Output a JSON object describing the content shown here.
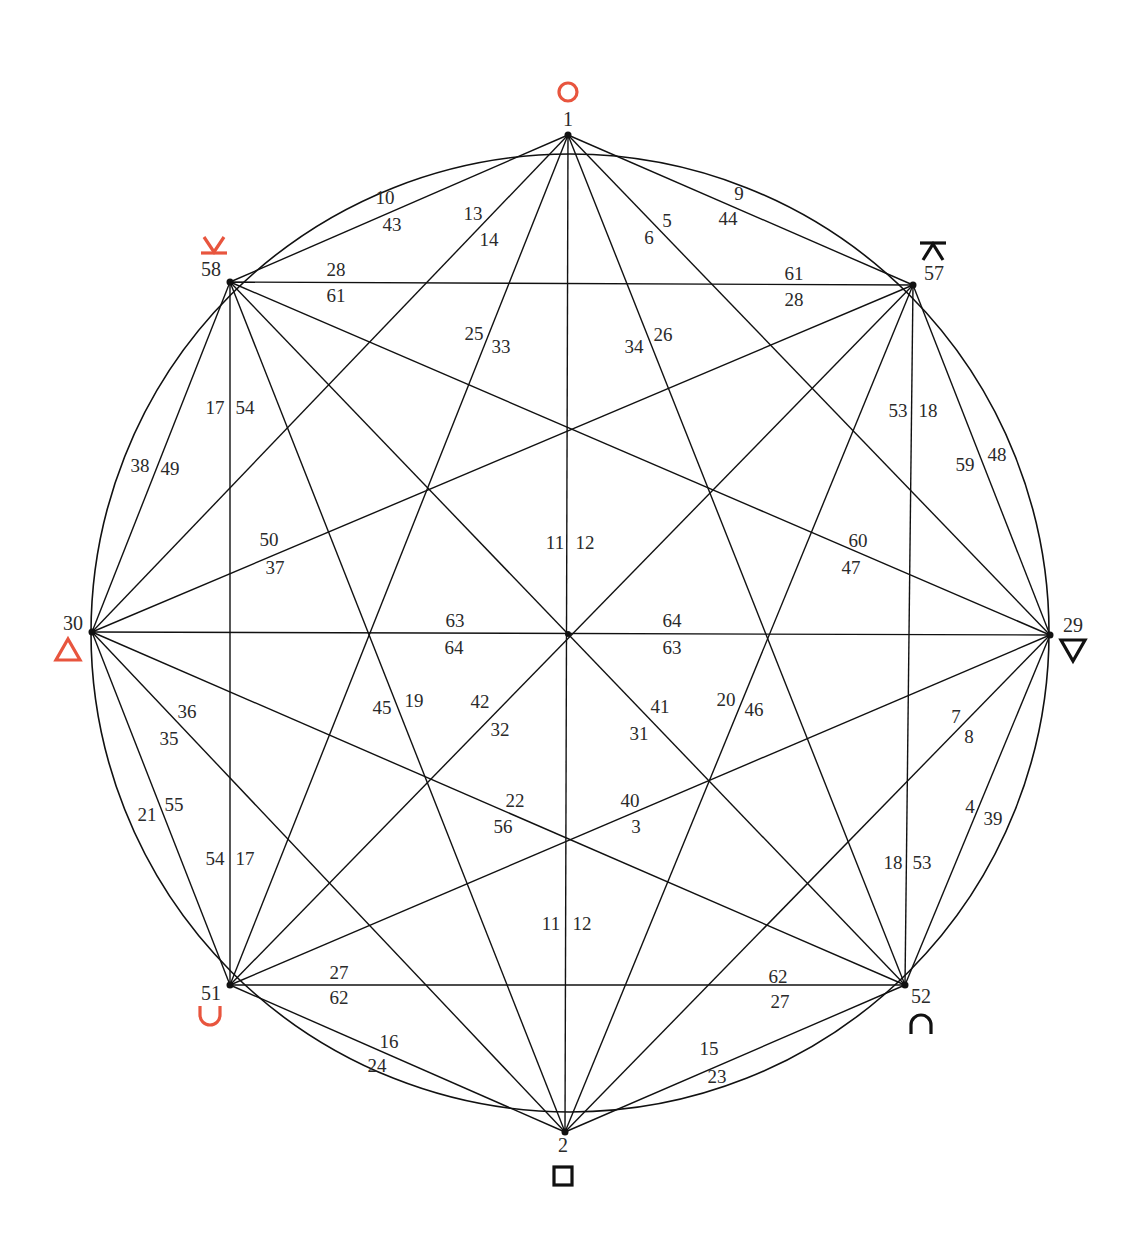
{
  "diagram": {
    "title": "",
    "circle": {
      "cx": 570,
      "cy": 633,
      "r": 479
    },
    "colors": {
      "line": "#111111",
      "accent_red": "#e8553e",
      "symbol_black": "#111111",
      "text": "#2a2a2a"
    },
    "vertices": [
      {
        "id": "v1",
        "label": "1",
        "x": 568,
        "y": 135,
        "lx": 568,
        "ly": 126,
        "symbol": "circle",
        "symbol_color": "red",
        "sx": 568,
        "sy": 92
      },
      {
        "id": "v57",
        "label": "57",
        "x": 913,
        "y": 285,
        "lx": 934,
        "ly": 280,
        "symbol": "bar-over-wedge",
        "symbol_color": "black",
        "sx": 933,
        "sy": 251
      },
      {
        "id": "v29",
        "label": "29",
        "x": 1050,
        "y": 635,
        "lx": 1073,
        "ly": 632,
        "symbol": "triangle-down",
        "symbol_color": "black",
        "sx": 1073,
        "sy": 650
      },
      {
        "id": "v52",
        "label": "52",
        "x": 905,
        "y": 985,
        "lx": 921,
        "ly": 1003,
        "symbol": "cap",
        "symbol_color": "black",
        "sx": 921,
        "sy": 1025
      },
      {
        "id": "v2",
        "label": "2",
        "x": 565,
        "y": 1132,
        "lx": 563,
        "ly": 1152,
        "symbol": "square",
        "symbol_color": "black",
        "sx": 563,
        "sy": 1176
      },
      {
        "id": "v51",
        "label": "51",
        "x": 230,
        "y": 985,
        "lx": 211,
        "ly": 1000,
        "symbol": "cup",
        "symbol_color": "red",
        "sx": 210,
        "sy": 1015
      },
      {
        "id": "v30",
        "label": "30",
        "x": 92,
        "y": 632,
        "lx": 73,
        "ly": 630,
        "symbol": "triangle-up",
        "symbol_color": "red",
        "sx": 68,
        "sy": 650
      },
      {
        "id": "v58",
        "label": "58",
        "x": 230,
        "y": 282,
        "lx": 211,
        "ly": 276,
        "symbol": "wedge-over-bar",
        "symbol_color": "red",
        "sx": 214,
        "sy": 246
      }
    ],
    "edges": [
      [
        "v1",
        "v57"
      ],
      [
        "v1",
        "v29"
      ],
      [
        "v1",
        "v52"
      ],
      [
        "v1",
        "v2"
      ],
      [
        "v1",
        "v51"
      ],
      [
        "v1",
        "v30"
      ],
      [
        "v1",
        "v58"
      ],
      [
        "v57",
        "v29"
      ],
      [
        "v57",
        "v52"
      ],
      [
        "v57",
        "v2"
      ],
      [
        "v57",
        "v51"
      ],
      [
        "v57",
        "v30"
      ],
      [
        "v57",
        "v58"
      ],
      [
        "v29",
        "v52"
      ],
      [
        "v29",
        "v2"
      ],
      [
        "v29",
        "v51"
      ],
      [
        "v29",
        "v30"
      ],
      [
        "v29",
        "v58"
      ],
      [
        "v52",
        "v2"
      ],
      [
        "v52",
        "v51"
      ],
      [
        "v52",
        "v30"
      ],
      [
        "v52",
        "v58"
      ],
      [
        "v2",
        "v51"
      ],
      [
        "v2",
        "v30"
      ],
      [
        "v2",
        "v58"
      ],
      [
        "v51",
        "v30"
      ],
      [
        "v51",
        "v58"
      ],
      [
        "v30",
        "v58"
      ]
    ],
    "edge_labels": [
      {
        "text": "10",
        "x": 385,
        "y": 204
      },
      {
        "text": "43",
        "x": 392,
        "y": 231
      },
      {
        "text": "13",
        "x": 473,
        "y": 220
      },
      {
        "text": "14",
        "x": 489,
        "y": 246
      },
      {
        "text": "9",
        "x": 739,
        "y": 200
      },
      {
        "text": "44",
        "x": 728,
        "y": 225
      },
      {
        "text": "5",
        "x": 667,
        "y": 227
      },
      {
        "text": "6",
        "x": 649,
        "y": 244
      },
      {
        "text": "28",
        "x": 336,
        "y": 276
      },
      {
        "text": "61",
        "x": 336,
        "y": 302
      },
      {
        "text": "61",
        "x": 794,
        "y": 280
      },
      {
        "text": "28",
        "x": 794,
        "y": 306
      },
      {
        "text": "25",
        "x": 474,
        "y": 340
      },
      {
        "text": "33",
        "x": 501,
        "y": 353
      },
      {
        "text": "34",
        "x": 634,
        "y": 353
      },
      {
        "text": "26",
        "x": 663,
        "y": 341
      },
      {
        "text": "17",
        "x": 215,
        "y": 414
      },
      {
        "text": "54",
        "x": 245,
        "y": 414
      },
      {
        "text": "53",
        "x": 898,
        "y": 417
      },
      {
        "text": "18",
        "x": 928,
        "y": 417
      },
      {
        "text": "38",
        "x": 140,
        "y": 472
      },
      {
        "text": "49",
        "x": 170,
        "y": 475
      },
      {
        "text": "59",
        "x": 965,
        "y": 471
      },
      {
        "text": "48",
        "x": 997,
        "y": 461
      },
      {
        "text": "11",
        "x": 555,
        "y": 549
      },
      {
        "text": "12",
        "x": 585,
        "y": 549
      },
      {
        "text": "50",
        "x": 269,
        "y": 546
      },
      {
        "text": "37",
        "x": 275,
        "y": 574
      },
      {
        "text": "60",
        "x": 858,
        "y": 547
      },
      {
        "text": "47",
        "x": 851,
        "y": 574
      },
      {
        "text": "63",
        "x": 455,
        "y": 627
      },
      {
        "text": "64",
        "x": 454,
        "y": 654
      },
      {
        "text": "64",
        "x": 672,
        "y": 627
      },
      {
        "text": "63",
        "x": 672,
        "y": 654
      },
      {
        "text": "36",
        "x": 187,
        "y": 718
      },
      {
        "text": "35",
        "x": 169,
        "y": 745
      },
      {
        "text": "45",
        "x": 382,
        "y": 714
      },
      {
        "text": "19",
        "x": 414,
        "y": 707
      },
      {
        "text": "42",
        "x": 480,
        "y": 708
      },
      {
        "text": "32",
        "x": 500,
        "y": 736
      },
      {
        "text": "41",
        "x": 660,
        "y": 713
      },
      {
        "text": "31",
        "x": 639,
        "y": 740
      },
      {
        "text": "20",
        "x": 726,
        "y": 706
      },
      {
        "text": "46",
        "x": 754,
        "y": 716
      },
      {
        "text": "7",
        "x": 956,
        "y": 723
      },
      {
        "text": "8",
        "x": 969,
        "y": 743
      },
      {
        "text": "21",
        "x": 147,
        "y": 821
      },
      {
        "text": "55",
        "x": 174,
        "y": 811
      },
      {
        "text": "22",
        "x": 515,
        "y": 807
      },
      {
        "text": "56",
        "x": 503,
        "y": 833
      },
      {
        "text": "40",
        "x": 630,
        "y": 807
      },
      {
        "text": "3",
        "x": 636,
        "y": 833
      },
      {
        "text": "4",
        "x": 970,
        "y": 813
      },
      {
        "text": "39",
        "x": 993,
        "y": 825
      },
      {
        "text": "54",
        "x": 215,
        "y": 865
      },
      {
        "text": "17",
        "x": 245,
        "y": 865
      },
      {
        "text": "18",
        "x": 893,
        "y": 869
      },
      {
        "text": "53",
        "x": 922,
        "y": 869
      },
      {
        "text": "11",
        "x": 551,
        "y": 930
      },
      {
        "text": "12",
        "x": 582,
        "y": 930
      },
      {
        "text": "27",
        "x": 339,
        "y": 979
      },
      {
        "text": "62",
        "x": 339,
        "y": 1004
      },
      {
        "text": "62",
        "x": 778,
        "y": 983
      },
      {
        "text": "27",
        "x": 780,
        "y": 1008
      },
      {
        "text": "16",
        "x": 389,
        "y": 1048
      },
      {
        "text": "24",
        "x": 377,
        "y": 1072
      },
      {
        "text": "15",
        "x": 709,
        "y": 1055
      },
      {
        "text": "23",
        "x": 717,
        "y": 1083
      }
    ]
  }
}
